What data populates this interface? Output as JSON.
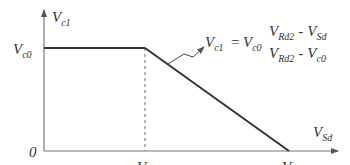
{
  "diagram": {
    "type": "piecewise-linear-graph",
    "y_axis_label": {
      "base": "V",
      "sub": "c1"
    },
    "x_axis_label": {
      "base": "V",
      "sub": "Sd"
    },
    "origin_label": "0",
    "y_tick_label": {
      "base": "V",
      "sub": "c0"
    },
    "x_tick_labels": [
      {
        "base": "V",
        "sub": "c0"
      },
      {
        "base": "V",
        "sub": "Rd2"
      }
    ],
    "equation": {
      "lhs": {
        "base": "V",
        "sub": "c1"
      },
      "equals": "=",
      "factor": {
        "base": "V",
        "sub": "c0"
      },
      "numerator": [
        {
          "base": "V",
          "sub": "Rd2"
        },
        {
          "op": "-"
        },
        {
          "base": "V",
          "sub": "Sd"
        }
      ],
      "denominator": [
        {
          "base": "V",
          "sub": "Rd2"
        },
        {
          "op": "-"
        },
        {
          "base": "V",
          "sub": "c0"
        }
      ]
    },
    "segments": [
      {
        "name": "flat",
        "from": [
          "0",
          "Vc0"
        ],
        "to": [
          "Vc0",
          "Vc0"
        ]
      },
      {
        "name": "falling",
        "from": [
          "Vc0",
          "Vc0"
        ],
        "to": [
          "VRd2",
          "0"
        ]
      }
    ],
    "colors": {
      "line": "#333333",
      "axis": "#666666"
    }
  }
}
